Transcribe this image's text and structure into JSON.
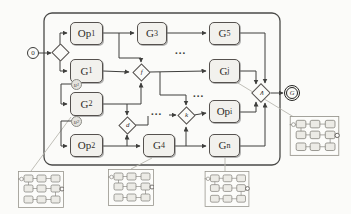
{
  "diagram": {
    "input_node": {
      "label": "0"
    },
    "output_node": {
      "label": "G"
    },
    "blocks": {
      "op1": {
        "base": "Op",
        "sub": "1"
      },
      "g3": {
        "base": "G",
        "sub": "3"
      },
      "g5": {
        "base": "G",
        "sub": "5"
      },
      "g1": {
        "base": "G",
        "sub": "1"
      },
      "gj": {
        "base": "G",
        "sub": "j"
      },
      "g2": {
        "base": "G",
        "sub": "2"
      },
      "opi": {
        "base": "Op",
        "sub": "i"
      },
      "op2": {
        "base": "Op",
        "sub": "2"
      },
      "g4": {
        "base": "G",
        "sub": "4"
      },
      "gn": {
        "base": "G",
        "sub": "n"
      }
    },
    "junctions": {
      "input": "",
      "f": "f",
      "d": "d",
      "k": "k",
      "and": "∧"
    },
    "ports": {
      "u1": {
        "base": "u",
        "sub": "1"
      },
      "u2": {
        "base": "u",
        "sub": "2"
      }
    },
    "ellipsis": "...",
    "colors": {
      "line": "#3f3f3d",
      "leader": "#b9b8b0",
      "box_fill": "#f2f1ed",
      "box_border": "#55514e",
      "thumb_border": "#97958d"
    }
  }
}
